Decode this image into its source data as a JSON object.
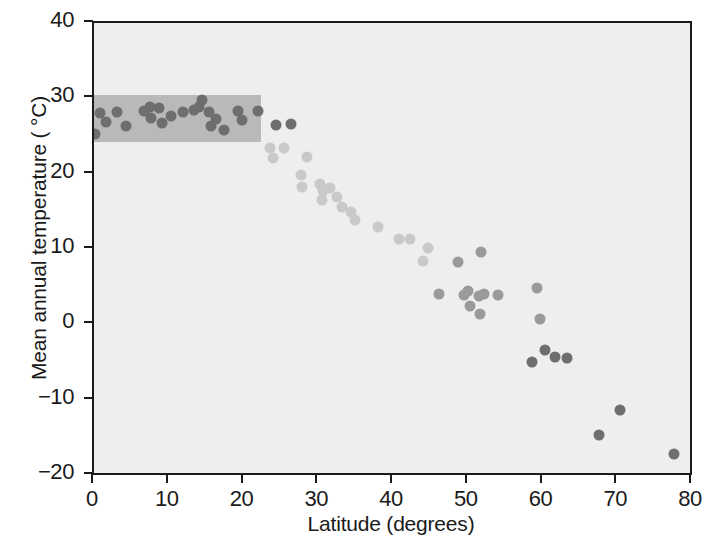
{
  "chart_data": {
    "type": "scatter",
    "title": "",
    "xlabel": "Latitude (degrees)",
    "ylabel": "Mean annual temperature ( °C)",
    "xlim": [
      0,
      80
    ],
    "ylim": [
      -20,
      40
    ],
    "xticks": [
      0,
      10,
      20,
      30,
      40,
      50,
      60,
      70,
      80
    ],
    "xtick_labels": [
      "0",
      "10",
      "20",
      "30",
      "40",
      "50",
      "60",
      "70",
      "80"
    ],
    "yticks": [
      -20,
      -10,
      0,
      10,
      20,
      30,
      40
    ],
    "ytick_labels": [
      "−20",
      "−10",
      "0",
      "10",
      "20",
      "30",
      "40"
    ],
    "grid": false,
    "legend": null,
    "background_color": "#eeeeec",
    "point_colors": {
      "dark": "#6e6e6e",
      "mid": "#9a9a9a",
      "light": "#c9c9c9"
    },
    "annotations": [
      {
        "name": "tropical-band",
        "type": "shaded-rectangle",
        "x_range": [
          0,
          22.6
        ],
        "y_range": [
          24.0,
          30.2
        ],
        "color": "#b9b9b7"
      }
    ],
    "points": [
      {
        "x": 0.4,
        "y": 25.0,
        "shade": "dark"
      },
      {
        "x": 1.1,
        "y": 27.8,
        "shade": "dark"
      },
      {
        "x": 1.9,
        "y": 26.6,
        "shade": "dark"
      },
      {
        "x": 3.3,
        "y": 27.9,
        "shade": "dark"
      },
      {
        "x": 4.6,
        "y": 26.0,
        "shade": "dark"
      },
      {
        "x": 7.0,
        "y": 28.1,
        "shade": "dark"
      },
      {
        "x": 7.7,
        "y": 28.6,
        "shade": "dark"
      },
      {
        "x": 7.9,
        "y": 27.1,
        "shade": "dark"
      },
      {
        "x": 9.0,
        "y": 28.4,
        "shade": "dark"
      },
      {
        "x": 9.3,
        "y": 26.4,
        "shade": "dark"
      },
      {
        "x": 10.6,
        "y": 27.4,
        "shade": "dark"
      },
      {
        "x": 12.2,
        "y": 27.9,
        "shade": "dark"
      },
      {
        "x": 13.6,
        "y": 28.2,
        "shade": "dark"
      },
      {
        "x": 14.3,
        "y": 28.6,
        "shade": "dark"
      },
      {
        "x": 14.7,
        "y": 29.5,
        "shade": "dark"
      },
      {
        "x": 15.6,
        "y": 27.9,
        "shade": "dark"
      },
      {
        "x": 15.9,
        "y": 26.0,
        "shade": "dark"
      },
      {
        "x": 16.6,
        "y": 27.0,
        "shade": "dark"
      },
      {
        "x": 17.6,
        "y": 25.5,
        "shade": "dark"
      },
      {
        "x": 19.5,
        "y": 28.1,
        "shade": "dark"
      },
      {
        "x": 20.0,
        "y": 26.9,
        "shade": "dark"
      },
      {
        "x": 22.2,
        "y": 28.1,
        "shade": "dark"
      },
      {
        "x": 24.6,
        "y": 26.2,
        "shade": "dark"
      },
      {
        "x": 26.6,
        "y": 26.3,
        "shade": "dark"
      },
      {
        "x": 23.8,
        "y": 23.2,
        "shade": "light"
      },
      {
        "x": 25.7,
        "y": 23.1,
        "shade": "light"
      },
      {
        "x": 24.2,
        "y": 21.8,
        "shade": "light"
      },
      {
        "x": 28.8,
        "y": 21.9,
        "shade": "light"
      },
      {
        "x": 27.9,
        "y": 19.6,
        "shade": "light"
      },
      {
        "x": 28.1,
        "y": 17.9,
        "shade": "light"
      },
      {
        "x": 30.5,
        "y": 18.3,
        "shade": "light"
      },
      {
        "x": 30.9,
        "y": 17.5,
        "shade": "light"
      },
      {
        "x": 30.8,
        "y": 16.3,
        "shade": "light"
      },
      {
        "x": 31.8,
        "y": 17.8,
        "shade": "light"
      },
      {
        "x": 32.8,
        "y": 16.6,
        "shade": "light"
      },
      {
        "x": 33.5,
        "y": 15.3,
        "shade": "light"
      },
      {
        "x": 34.6,
        "y": 14.7,
        "shade": "light"
      },
      {
        "x": 35.2,
        "y": 13.6,
        "shade": "light"
      },
      {
        "x": 38.3,
        "y": 12.6,
        "shade": "light"
      },
      {
        "x": 41.1,
        "y": 11.1,
        "shade": "light"
      },
      {
        "x": 42.5,
        "y": 11.0,
        "shade": "light"
      },
      {
        "x": 45.0,
        "y": 9.9,
        "shade": "light"
      },
      {
        "x": 44.3,
        "y": 8.1,
        "shade": "light"
      },
      {
        "x": 46.4,
        "y": 3.8,
        "shade": "mid"
      },
      {
        "x": 49.7,
        "y": 3.6,
        "shade": "mid"
      },
      {
        "x": 50.3,
        "y": 4.2,
        "shade": "mid"
      },
      {
        "x": 50.6,
        "y": 2.2,
        "shade": "mid"
      },
      {
        "x": 51.8,
        "y": 3.5,
        "shade": "mid"
      },
      {
        "x": 52.4,
        "y": 3.8,
        "shade": "mid"
      },
      {
        "x": 51.9,
        "y": 1.1,
        "shade": "mid"
      },
      {
        "x": 54.3,
        "y": 3.6,
        "shade": "mid"
      },
      {
        "x": 49.0,
        "y": 8.0,
        "shade": "mid"
      },
      {
        "x": 52.0,
        "y": 9.4,
        "shade": "mid"
      },
      {
        "x": 59.5,
        "y": 4.5,
        "shade": "mid"
      },
      {
        "x": 59.9,
        "y": 0.4,
        "shade": "mid"
      },
      {
        "x": 58.9,
        "y": -5.2,
        "shade": "dark"
      },
      {
        "x": 60.6,
        "y": -3.7,
        "shade": "dark"
      },
      {
        "x": 61.9,
        "y": -4.6,
        "shade": "dark"
      },
      {
        "x": 63.6,
        "y": -4.8,
        "shade": "dark"
      },
      {
        "x": 67.8,
        "y": -14.9,
        "shade": "dark"
      },
      {
        "x": 70.7,
        "y": -11.6,
        "shade": "dark"
      },
      {
        "x": 77.8,
        "y": -17.5,
        "shade": "dark"
      }
    ]
  }
}
